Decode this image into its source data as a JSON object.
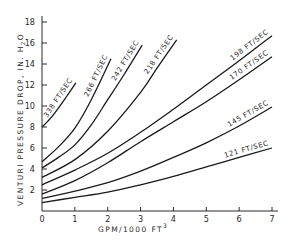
{
  "chart_data": {
    "type": "line",
    "title": "",
    "xlabel": "GPM/1000 FT",
    "xlabel_superscript": "3",
    "ylabel": "VENTURI  PRESSURE  DROP, IN. H",
    "ylabel_subscript": "2",
    "ylabel_suffix": "O",
    "xlim": [
      0,
      7
    ],
    "ylim": [
      0,
      18
    ],
    "xticks": [
      0,
      1,
      2,
      3,
      4,
      5,
      6,
      7
    ],
    "yticks": [
      2,
      4,
      6,
      8,
      10,
      12,
      14,
      16,
      18
    ],
    "grid": false,
    "legend": "inline-labels",
    "series": [
      {
        "name": "338 FT/SEC",
        "x": [
          0,
          0.25,
          0.5,
          0.75,
          1.03
        ],
        "y": [
          8.0,
          8.8,
          9.8,
          10.9,
          12.2
        ]
      },
      {
        "name": "266 FT/SEC",
        "x": [
          0,
          0.5,
          1,
          1.5,
          2.1
        ],
        "y": [
          4.7,
          6.1,
          7.9,
          10.6,
          14.5
        ]
      },
      {
        "name": "242 FT/SEC",
        "x": [
          0,
          0.5,
          1,
          1.5,
          2,
          2.5,
          3.05
        ],
        "y": [
          4.1,
          5.1,
          6.3,
          8.2,
          10.6,
          13.0,
          15.8
        ]
      },
      {
        "name": "218 FT/SEC",
        "x": [
          0,
          1,
          2,
          3,
          3.5,
          4.1
        ],
        "y": [
          3.2,
          4.9,
          7.6,
          11.3,
          13.6,
          16.3
        ]
      },
      {
        "name": "198 FT/SEC",
        "x": [
          0,
          1,
          2,
          3,
          4,
          5,
          6,
          7
        ],
        "y": [
          2.5,
          3.9,
          5.5,
          7.5,
          9.7,
          12.0,
          14.3,
          16.7
        ]
      },
      {
        "name": "170 FT/SEC",
        "x": [
          0,
          1,
          2,
          3,
          4,
          5,
          6,
          7
        ],
        "y": [
          1.6,
          2.9,
          4.6,
          6.6,
          8.5,
          10.4,
          12.5,
          14.7
        ]
      },
      {
        "name": "145 FT/SEC",
        "x": [
          0,
          1,
          2,
          3,
          4,
          5,
          6,
          7
        ],
        "y": [
          1.2,
          1.9,
          2.7,
          3.8,
          5.1,
          6.5,
          8.1,
          9.9
        ]
      },
      {
        "name": "121 FT/SEC",
        "x": [
          0,
          1,
          2,
          3,
          4,
          5,
          6,
          7
        ],
        "y": [
          0.8,
          1.3,
          1.8,
          2.5,
          3.3,
          4.2,
          5.1,
          6.0
        ]
      }
    ]
  }
}
